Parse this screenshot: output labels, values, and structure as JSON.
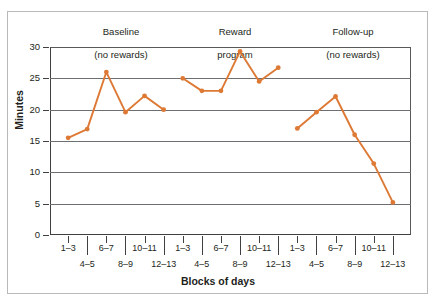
{
  "figure": {
    "accent_color": "#dd7934",
    "axis_color": "#404040",
    "grid_color": "#6d6e71",
    "frame_color": "#b9b9b9"
  },
  "axes": {
    "y_title": "Minutes",
    "x_title": "Blocks of days",
    "y_ticks": [
      "0",
      "5",
      "10",
      "15",
      "20",
      "25",
      "30"
    ],
    "x_tick_labels": [
      "1–3",
      "4–5",
      "6–7",
      "8–9",
      "10–11",
      "12–13"
    ]
  },
  "groups": [
    {
      "line1": "Baseline",
      "line2": "(no rewards)"
    },
    {
      "line1": "Reward",
      "line2": "program"
    },
    {
      "line1": "Follow-up",
      "line2": "(no rewards)"
    }
  ],
  "chart_data": {
    "type": "line",
    "title": "",
    "subtitle": "",
    "xlabel": "Blocks of days",
    "ylabel": "Minutes",
    "ylim": [
      0,
      30
    ],
    "yticks": [
      0,
      5,
      10,
      15,
      20,
      25,
      30
    ],
    "grid": "horizontal",
    "legend": "none",
    "phase_annotations": [
      "Baseline (no rewards)",
      "Reward program",
      "Follow-up (no rewards)"
    ],
    "categories": [
      "1–3",
      "4–5",
      "6–7",
      "8–9",
      "10–11",
      "12–13",
      "1–3",
      "4–5",
      "6–7",
      "8–9",
      "10–11",
      "12–13",
      "1–3",
      "4–5",
      "6–7",
      "8–9",
      "10–11",
      "12–13"
    ],
    "series": [
      {
        "name": "Minutes spent",
        "segments": [
          {
            "phase": "Baseline (no rewards)",
            "categories": [
              "1–3",
              "4–5",
              "6–7",
              "8–9",
              "10–11",
              "12–13"
            ],
            "values": [
              15.5,
              16.9,
              26.0,
              19.6,
              22.2,
              20.0
            ]
          },
          {
            "phase": "Reward program",
            "categories": [
              "1–3",
              "4–5",
              "6–7",
              "8–9",
              "10–11",
              "12–13"
            ],
            "values": [
              25.0,
              23.0,
              23.0,
              29.3,
              24.5,
              26.7
            ]
          },
          {
            "phase": "Follow-up (no rewards)",
            "categories": [
              "1–3",
              "4–5",
              "6–7",
              "8–9",
              "10–11",
              "12–13"
            ],
            "values": [
              17.0,
              19.6,
              22.1,
              16.0,
              11.4,
              5.2
            ]
          }
        ]
      }
    ]
  }
}
